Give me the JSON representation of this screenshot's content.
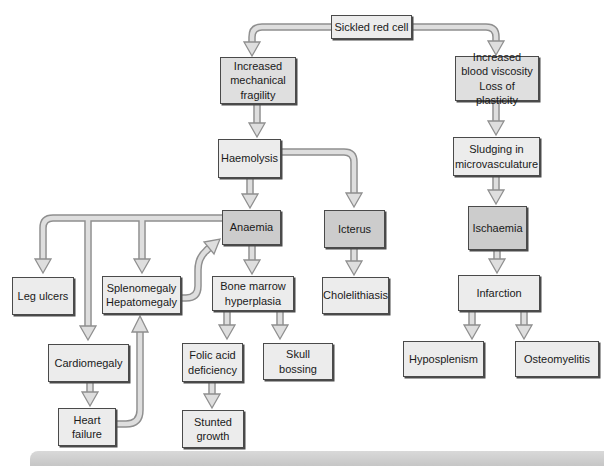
{
  "colors": {
    "node_fill_light": "#ececec",
    "node_fill_medium": "#dfdfdf",
    "node_fill_dark": "#cccccc",
    "node_border": "#4a4a4a",
    "arrow_fill": "#dedede",
    "arrow_outline": "#8f8f8f",
    "footer_bar": "#d9d9d9"
  },
  "nodes": {
    "sickled": {
      "label": "Sickled red cell"
    },
    "mech_fragility": {
      "label": "Increased\nmechanical\nfragility"
    },
    "blood_viscosity": {
      "label": "Increased\nblood viscosity\nLoss of plasticity"
    },
    "haemolysis": {
      "label": "Haemolysis"
    },
    "sludging": {
      "label": "Sludging in\nmicrovasculature"
    },
    "anaemia": {
      "label": "Anaemia"
    },
    "icterus": {
      "label": "Icterus"
    },
    "ischaemia": {
      "label": "Ischaemia"
    },
    "leg_ulcers": {
      "label": "Leg ulcers"
    },
    "splenomegaly": {
      "label": "Splenomegaly\nHepatomegaly"
    },
    "bone_marrow": {
      "label": "Bone marrow\nhyperplasia"
    },
    "cholelithiasis": {
      "label": "Cholelithiasis"
    },
    "infarction": {
      "label": "Infarction"
    },
    "cardiomegaly": {
      "label": "Cardiomegaly"
    },
    "folic_acid": {
      "label": "Folic acid\ndeficiency"
    },
    "skull_bossing": {
      "label": "Skull\nbossing"
    },
    "hyposplenism": {
      "label": "Hyposplenism"
    },
    "osteomyelitis": {
      "label": "Osteomyelitis"
    },
    "heart_failure": {
      "label": "Heart\nfailure"
    },
    "stunted_growth": {
      "label": "Stunted\ngrowth"
    }
  },
  "edges": [
    {
      "from": "sickled",
      "to": "mech_fragility"
    },
    {
      "from": "sickled",
      "to": "blood_viscosity"
    },
    {
      "from": "mech_fragility",
      "to": "haemolysis"
    },
    {
      "from": "haemolysis",
      "to": "anaemia"
    },
    {
      "from": "haemolysis",
      "to": "icterus"
    },
    {
      "from": "blood_viscosity",
      "to": "sludging"
    },
    {
      "from": "sludging",
      "to": "ischaemia"
    },
    {
      "from": "ischaemia",
      "to": "infarction"
    },
    {
      "from": "infarction",
      "to": "hyposplenism"
    },
    {
      "from": "infarction",
      "to": "osteomyelitis"
    },
    {
      "from": "anaemia",
      "to": "leg_ulcers"
    },
    {
      "from": "anaemia",
      "to": "cardiomegaly"
    },
    {
      "from": "anaemia",
      "to": "splenomegaly"
    },
    {
      "from": "anaemia",
      "to": "bone_marrow"
    },
    {
      "from": "splenomegaly",
      "to": "anaemia"
    },
    {
      "from": "cardiomegaly",
      "to": "heart_failure"
    },
    {
      "from": "heart_failure",
      "to": "splenomegaly"
    },
    {
      "from": "icterus",
      "to": "cholelithiasis"
    },
    {
      "from": "bone_marrow",
      "to": "folic_acid"
    },
    {
      "from": "bone_marrow",
      "to": "skull_bossing"
    },
    {
      "from": "folic_acid",
      "to": "stunted_growth"
    }
  ]
}
